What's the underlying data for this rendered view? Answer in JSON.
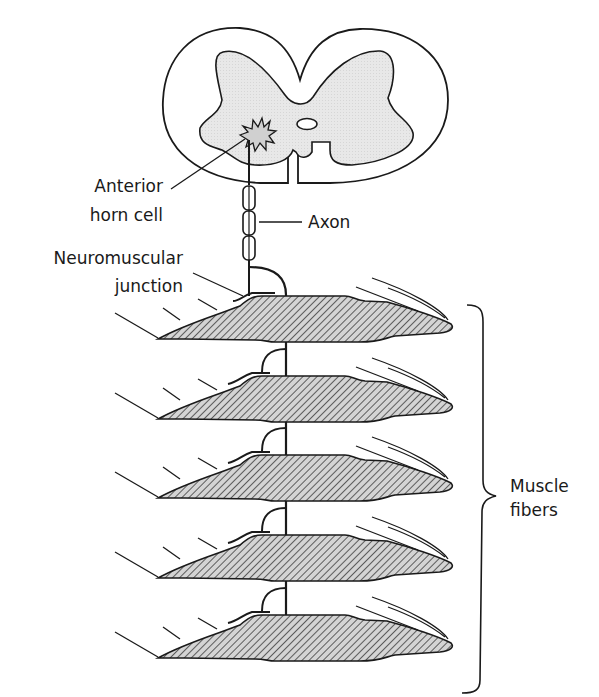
{
  "diagram": {
    "colors": {
      "line": "#1a1a1a",
      "gray_matter": "#e6e6e6",
      "fiber_fill": "#cfcfcf",
      "background": "#ffffff"
    },
    "labels": {
      "anterior_horn_cell": [
        "Anterior",
        "horn cell"
      ],
      "axon": "Axon",
      "neuromuscular_junction": [
        "Neuromuscular",
        "junction"
      ],
      "muscle_fibers": [
        "Muscle",
        "fibers"
      ]
    },
    "muscle_fiber_count": 5
  }
}
